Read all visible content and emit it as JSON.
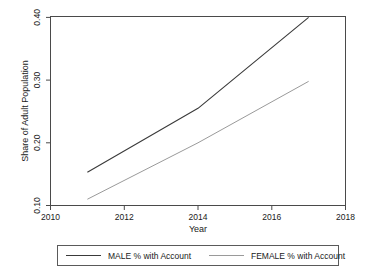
{
  "chart_data": {
    "type": "line",
    "title": "",
    "xlabel": "Year",
    "ylabel": "Share of Adult Population",
    "xlim": [
      2010,
      2018
    ],
    "ylim": [
      0.1,
      0.4
    ],
    "grid": false,
    "legend_position": "bottom",
    "xticks": [
      "2010",
      "2012",
      "2014",
      "2016",
      "2018"
    ],
    "xtick_values": [
      2010,
      2012,
      2014,
      2016,
      2018
    ],
    "yticks": [
      "0.10",
      "0.20",
      "0.30",
      "0.40"
    ],
    "ytick_values": [
      0.1,
      0.2,
      0.3,
      0.4
    ],
    "x": [
      2011,
      2014,
      2017
    ],
    "series": [
      {
        "name": "MALE % with Account",
        "values": [
          0.153,
          0.255,
          0.4
        ],
        "color": "#3a3a3a",
        "width": 1.1
      },
      {
        "name": "FEMALE % with Account",
        "values": [
          0.11,
          0.2,
          0.298
        ],
        "color": "#9a9a9a",
        "width": 1.0
      }
    ]
  },
  "legend": {
    "entries": [
      {
        "label": "MALE % with Account"
      },
      {
        "label": "FEMALE % with Account"
      }
    ]
  }
}
